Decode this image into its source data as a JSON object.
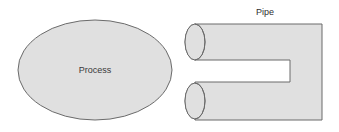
{
  "canvas": {
    "width": 339,
    "height": 132,
    "background": "#ffffff"
  },
  "theme": {
    "shape_fill": "#e0e0e0",
    "shape_stroke": "#6b6b6b",
    "label_color": "#3a3a3a",
    "pipe_inner_fill": "#ffffff"
  },
  "diagram": {
    "type": "process-flow-sketch",
    "shapes": [
      {
        "id": "process-ellipse",
        "kind": "ellipse",
        "label": "Process",
        "label_x": 95,
        "label_y": 71,
        "cx": 95,
        "cy": 70,
        "rx": 77,
        "ry": 50,
        "fill": "#e0e0e0",
        "stroke": "#6b6b6b"
      },
      {
        "id": "pipe-shape",
        "kind": "u-pipe",
        "label": "Pipe",
        "label_x": 265,
        "label_y": 13,
        "fill": "#e0e0e0",
        "stroke": "#6b6b6b",
        "body_left": 195,
        "body_right": 322,
        "body_top": 24,
        "body_bottom": 120,
        "notch_left": 200,
        "notch_right": 290,
        "notch_top": 60,
        "notch_bottom": 82,
        "cap_rx": 10,
        "cap_ry": 18,
        "cap_top_cy": 42,
        "cap_bottom_cy": 101
      }
    ]
  }
}
